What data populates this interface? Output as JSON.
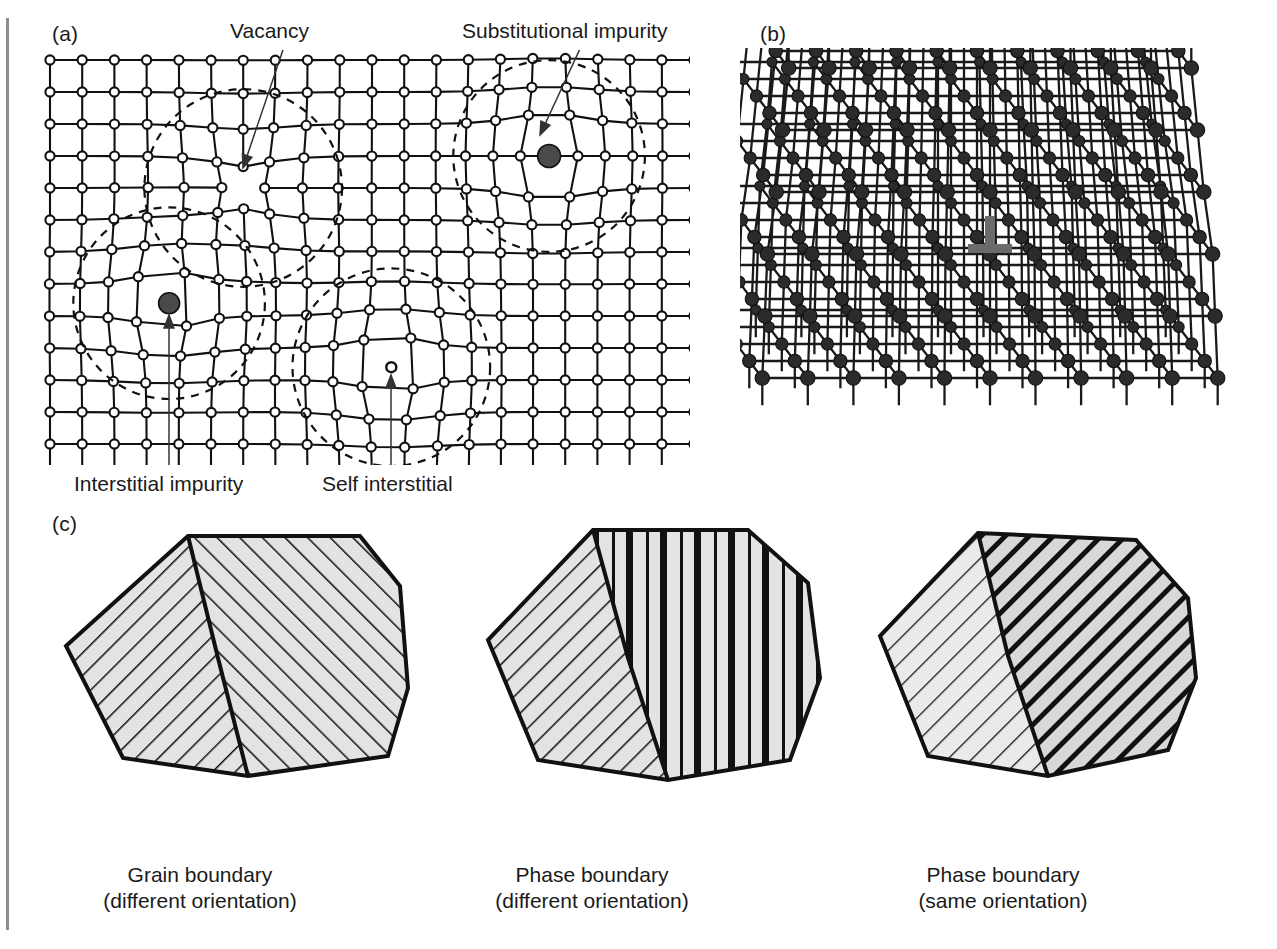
{
  "figure": {
    "panels": [
      {
        "id": "a",
        "letter": "(a)",
        "title": "point-defects-lattice"
      },
      {
        "id": "b",
        "letter": "(b)",
        "title": "edge-dislocation-lattice"
      },
      {
        "id": "c",
        "letter": "(c)",
        "title": "grain-and-phase-boundaries"
      }
    ]
  },
  "panel_a": {
    "letter": "(a)",
    "labels": {
      "vacancy": "Vacancy",
      "substitutional_impurity": "Substitutional impurity",
      "interstitial_impurity": "Interstitial impurity",
      "self_interstitial": "Self interstitial"
    },
    "defects": [
      {
        "name": "vacancy",
        "kind": "missing-atom",
        "marker": "none"
      },
      {
        "name": "substitutional-impurity",
        "kind": "substituted-atom",
        "marker": "large-filled-circle"
      },
      {
        "name": "interstitial-impurity",
        "kind": "interstitial-atom",
        "marker": "large-filled-circle"
      },
      {
        "name": "self-interstitial",
        "kind": "interstitial-atom",
        "marker": "small-open-circle"
      }
    ],
    "lattice": {
      "atom_marker": "open-circle",
      "grid_cols": 20,
      "grid_rows": 13,
      "strain_field_marker": "dashed-circle"
    },
    "colors": {
      "lattice_line": "#111111",
      "atom_fill": "#ffffff",
      "impurity_fill": "#4a4a4a"
    }
  },
  "panel_b": {
    "letter": "(b)",
    "symbol": "edge-dislocation",
    "colors": {
      "lattice_line": "#1a1a1a",
      "atom_fill": "#2b2b2b",
      "dislocation_symbol": "#6b6b6b"
    }
  },
  "panel_c": {
    "letter": "(c)",
    "grains": [
      {
        "name": "grain-boundary",
        "caption_line1": "Grain boundary",
        "caption_line2": "(different orientation)",
        "left_fill": "hatch-diagonal-down",
        "right_fill": "hatch-diagonal-up"
      },
      {
        "name": "phase-boundary-different-orientation",
        "caption_line1": "Phase boundary",
        "caption_line2": "(different orientation)",
        "left_fill": "hatch-diagonal-down",
        "right_fill": "stripes-vertical"
      },
      {
        "name": "phase-boundary-same-orientation",
        "caption_line1": "Phase boundary",
        "caption_line2": "(same orientation)",
        "left_fill": "hatch-diagonal-down-thin",
        "right_fill": "hatch-diagonal-down-thick"
      }
    ],
    "colors": {
      "outline": "#111111",
      "grain_fill": "#e3e3e3",
      "hatch": "#111111"
    }
  }
}
